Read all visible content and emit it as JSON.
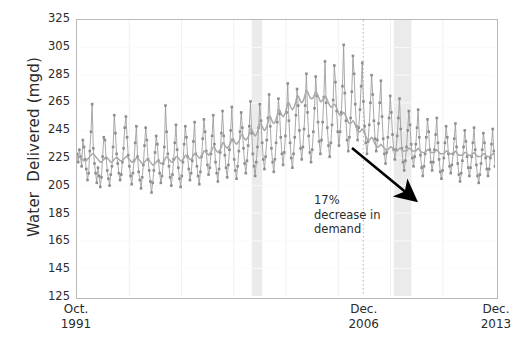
{
  "chart_data": {
    "type": "line",
    "title": "",
    "xlabel": "",
    "ylabel": "Water  Delivered (mgd)",
    "ylim": [
      125,
      325
    ],
    "yticks": [
      325,
      305,
      285,
      265,
      245,
      225,
      205,
      185,
      165,
      145,
      125
    ],
    "xticks": [
      {
        "line1": "Oct.",
        "line2": "1991",
        "pos": 0.0
      },
      {
        "line1": "Dec.",
        "line2": "2006",
        "pos": 0.685
      },
      {
        "line1": "Dec.",
        "line2": "2013",
        "pos": 1.0
      }
    ],
    "grid": true,
    "legend_position": "none",
    "series": [
      {
        "name": "Water delivered (monthly)",
        "color": "#9a9a9a",
        "marker": "square",
        "values": [
          228,
          222,
          231,
          226,
          219,
          238,
          233,
          224,
          217,
          209,
          214,
          230,
          244,
          264,
          232,
          221,
          214,
          207,
          218,
          212,
          204,
          211,
          226,
          240,
          238,
          225,
          216,
          210,
          205,
          213,
          219,
          233,
          256,
          243,
          228,
          221,
          214,
          209,
          213,
          222,
          232,
          247,
          255,
          240,
          227,
          219,
          212,
          206,
          214,
          223,
          236,
          248,
          226,
          215,
          209,
          203,
          211,
          220,
          234,
          247,
          238,
          224,
          216,
          208,
          200,
          207,
          216,
          229,
          241,
          235,
          223,
          214,
          207,
          212,
          221,
          233,
          263,
          244,
          228,
          219,
          211,
          205,
          213,
          224,
          236,
          249,
          231,
          218,
          210,
          204,
          212,
          222,
          235,
          248,
          240,
          226,
          217,
          209,
          214,
          223,
          237,
          251,
          228,
          219,
          212,
          206,
          215,
          226,
          239,
          253,
          244,
          230,
          220,
          213,
          218,
          228,
          241,
          256,
          235,
          222,
          214,
          208,
          217,
          229,
          243,
          259,
          241,
          227,
          218,
          211,
          220,
          231,
          245,
          262,
          238,
          224,
          216,
          210,
          219,
          230,
          244,
          258,
          247,
          232,
          221,
          214,
          223,
          234,
          248,
          266,
          243,
          228,
          219,
          212,
          222,
          233,
          247,
          264,
          252,
          236,
          224,
          217,
          226,
          238,
          254,
          271,
          248,
          232,
          222,
          215,
          224,
          236,
          251,
          268,
          257,
          240,
          228,
          220,
          229,
          241,
          258,
          279,
          252,
          236,
          225,
          218,
          228,
          240,
          256,
          275,
          263,
          245,
          232,
          224,
          233,
          246,
          263,
          286,
          258,
          241,
          229,
          222,
          231,
          244,
          261,
          284,
          270,
          251,
          237,
          228,
          238,
          251,
          269,
          295,
          265,
          247,
          234,
          226,
          236,
          249,
          267,
          292,
          280,
          259,
          244,
          234,
          244,
          258,
          277,
          307,
          272,
          252,
          238,
          230,
          240,
          254,
          273,
          299,
          286,
          264,
          248,
          238,
          247,
          260,
          277,
          294,
          266,
          248,
          236,
          228,
          237,
          249,
          265,
          285,
          271,
          252,
          239,
          230,
          238,
          250,
          265,
          281,
          255,
          239,
          228,
          221,
          229,
          240,
          254,
          270,
          258,
          242,
          231,
          224,
          231,
          241,
          254,
          268,
          246,
          232,
          222,
          216,
          223,
          233,
          245,
          259,
          249,
          235,
          225,
          219,
          226,
          235,
          247,
          260,
          240,
          227,
          218,
          212,
          219,
          228,
          240,
          253,
          244,
          231,
          222,
          216,
          222,
          231,
          242,
          254,
          236,
          224,
          215,
          210,
          216,
          225,
          236,
          248,
          240,
          228,
          219,
          214,
          220,
          228,
          239,
          250,
          233,
          221,
          213,
          208,
          214,
          223,
          233,
          245,
          237,
          226,
          218,
          212,
          218,
          226,
          236,
          247,
          231,
          220,
          212,
          207,
          213,
          221,
          231,
          243,
          236,
          225,
          217,
          212,
          217,
          225,
          235,
          246,
          230,
          219
        ]
      },
      {
        "name": "Smoothed trend",
        "color": "#a9a9a9",
        "marker": "none",
        "values": [
          227,
          226,
          226,
          225,
          224,
          224,
          223,
          223,
          223,
          224,
          225,
          226,
          227,
          228,
          228,
          227,
          226,
          225,
          224,
          223,
          222,
          222,
          223,
          224,
          225,
          225,
          225,
          224,
          223,
          222,
          222,
          223,
          224,
          225,
          225,
          225,
          224,
          223,
          223,
          223,
          224,
          225,
          226,
          226,
          225,
          224,
          223,
          222,
          222,
          223,
          224,
          225,
          225,
          224,
          223,
          222,
          221,
          221,
          222,
          223,
          224,
          224,
          223,
          222,
          221,
          220,
          220,
          221,
          222,
          223,
          223,
          222,
          221,
          221,
          222,
          223,
          225,
          226,
          225,
          224,
          223,
          222,
          222,
          223,
          224,
          226,
          226,
          225,
          224,
          223,
          223,
          224,
          225,
          227,
          227,
          226,
          225,
          224,
          224,
          225,
          227,
          228,
          228,
          227,
          226,
          225,
          225,
          226,
          228,
          230,
          230,
          229,
          228,
          227,
          228,
          229,
          231,
          233,
          233,
          231,
          230,
          229,
          230,
          231,
          233,
          236,
          236,
          234,
          233,
          232,
          233,
          234,
          236,
          239,
          239,
          237,
          236,
          235,
          236,
          237,
          239,
          242,
          242,
          240,
          239,
          238,
          239,
          240,
          243,
          246,
          246,
          244,
          242,
          241,
          242,
          244,
          247,
          250,
          250,
          248,
          246,
          245,
          246,
          248,
          251,
          255,
          255,
          253,
          251,
          250,
          251,
          253,
          256,
          260,
          260,
          258,
          256,
          255,
          256,
          258,
          261,
          265,
          265,
          263,
          261,
          260,
          261,
          263,
          266,
          270,
          270,
          268,
          266,
          265,
          266,
          268,
          271,
          274,
          273,
          271,
          269,
          268,
          268,
          269,
          271,
          273,
          272,
          270,
          268,
          266,
          266,
          267,
          268,
          270,
          269,
          267,
          265,
          263,
          262,
          262,
          263,
          264,
          263,
          261,
          259,
          257,
          256,
          256,
          257,
          258,
          257,
          255,
          253,
          251,
          250,
          250,
          251,
          252,
          251,
          249,
          247,
          245,
          244,
          244,
          245,
          246,
          245,
          243,
          241,
          239,
          238,
          238,
          239,
          240,
          239,
          237,
          235,
          234,
          233,
          233,
          234,
          235,
          234,
          233,
          232,
          231,
          231,
          231,
          232,
          233,
          233,
          232,
          231,
          230,
          230,
          230,
          231,
          232,
          232,
          231,
          230,
          230,
          230,
          230,
          231,
          232,
          232,
          231,
          230,
          230,
          230,
          230,
          231,
          232,
          231,
          230,
          229,
          229,
          229,
          229,
          230,
          231,
          231,
          230,
          229,
          229,
          229,
          229,
          230,
          231,
          230,
          229,
          228,
          228,
          228,
          228,
          229,
          230,
          230,
          229,
          228,
          228,
          228,
          228,
          229,
          230,
          229,
          228,
          227,
          227,
          227,
          227,
          228,
          229,
          229,
          228,
          227,
          227,
          227,
          227,
          228,
          229,
          228,
          227,
          226,
          226,
          226,
          226,
          227,
          228,
          228,
          227,
          226,
          226,
          226,
          226,
          227,
          228,
          228,
          227
        ]
      }
    ],
    "shaded_bands": [
      {
        "name": "recession-band-1",
        "x0": 0.418,
        "x1": 0.443,
        "color": "#e8e8e8"
      },
      {
        "name": "recession-band-2",
        "x0": 0.758,
        "x1": 0.8,
        "color": "#e8e8e8"
      }
    ],
    "vertical_marker": {
      "name": "dec-2006-marker",
      "pos": 0.685,
      "color": "#c0c0c0"
    },
    "annotations": [
      {
        "name": "demand-decrease-note",
        "text": "17%\ndecrease in\ndemand",
        "x": 314,
        "y": 193
      }
    ],
    "arrow": {
      "name": "decline-arrow",
      "x1": 352,
      "y1": 148,
      "x2": 414,
      "y2": 199,
      "color": "#000000"
    }
  }
}
